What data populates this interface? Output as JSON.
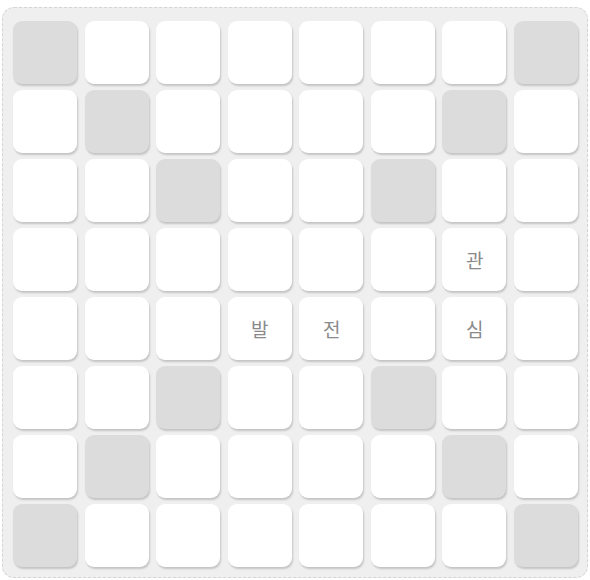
{
  "puzzle": {
    "rows": 8,
    "cols": 8,
    "colors": {
      "board": "#efefef",
      "cell": "#ffffff",
      "shaded": "#dcdcdc",
      "text": "#8a8a8a"
    },
    "grid": [
      [
        {
          "shaded": true,
          "char": ""
        },
        {
          "shaded": false,
          "char": ""
        },
        {
          "shaded": false,
          "char": ""
        },
        {
          "shaded": false,
          "char": ""
        },
        {
          "shaded": false,
          "char": ""
        },
        {
          "shaded": false,
          "char": ""
        },
        {
          "shaded": false,
          "char": ""
        },
        {
          "shaded": true,
          "char": ""
        }
      ],
      [
        {
          "shaded": false,
          "char": ""
        },
        {
          "shaded": true,
          "char": ""
        },
        {
          "shaded": false,
          "char": ""
        },
        {
          "shaded": false,
          "char": ""
        },
        {
          "shaded": false,
          "char": ""
        },
        {
          "shaded": false,
          "char": ""
        },
        {
          "shaded": true,
          "char": ""
        },
        {
          "shaded": false,
          "char": ""
        }
      ],
      [
        {
          "shaded": false,
          "char": ""
        },
        {
          "shaded": false,
          "char": ""
        },
        {
          "shaded": true,
          "char": ""
        },
        {
          "shaded": false,
          "char": ""
        },
        {
          "shaded": false,
          "char": ""
        },
        {
          "shaded": true,
          "char": ""
        },
        {
          "shaded": false,
          "char": ""
        },
        {
          "shaded": false,
          "char": ""
        }
      ],
      [
        {
          "shaded": false,
          "char": ""
        },
        {
          "shaded": false,
          "char": ""
        },
        {
          "shaded": false,
          "char": ""
        },
        {
          "shaded": false,
          "char": ""
        },
        {
          "shaded": false,
          "char": ""
        },
        {
          "shaded": false,
          "char": ""
        },
        {
          "shaded": false,
          "char": "관"
        },
        {
          "shaded": false,
          "char": ""
        }
      ],
      [
        {
          "shaded": false,
          "char": ""
        },
        {
          "shaded": false,
          "char": ""
        },
        {
          "shaded": false,
          "char": ""
        },
        {
          "shaded": false,
          "char": "발"
        },
        {
          "shaded": false,
          "char": "전"
        },
        {
          "shaded": false,
          "char": ""
        },
        {
          "shaded": false,
          "char": "심"
        },
        {
          "shaded": false,
          "char": ""
        }
      ],
      [
        {
          "shaded": false,
          "char": ""
        },
        {
          "shaded": false,
          "char": ""
        },
        {
          "shaded": true,
          "char": ""
        },
        {
          "shaded": false,
          "char": ""
        },
        {
          "shaded": false,
          "char": ""
        },
        {
          "shaded": true,
          "char": ""
        },
        {
          "shaded": false,
          "char": ""
        },
        {
          "shaded": false,
          "char": ""
        }
      ],
      [
        {
          "shaded": false,
          "char": ""
        },
        {
          "shaded": true,
          "char": ""
        },
        {
          "shaded": false,
          "char": ""
        },
        {
          "shaded": false,
          "char": ""
        },
        {
          "shaded": false,
          "char": ""
        },
        {
          "shaded": false,
          "char": ""
        },
        {
          "shaded": true,
          "char": ""
        },
        {
          "shaded": false,
          "char": ""
        }
      ],
      [
        {
          "shaded": true,
          "char": ""
        },
        {
          "shaded": false,
          "char": ""
        },
        {
          "shaded": false,
          "char": ""
        },
        {
          "shaded": false,
          "char": ""
        },
        {
          "shaded": false,
          "char": ""
        },
        {
          "shaded": false,
          "char": ""
        },
        {
          "shaded": false,
          "char": ""
        },
        {
          "shaded": true,
          "char": ""
        }
      ]
    ]
  }
}
